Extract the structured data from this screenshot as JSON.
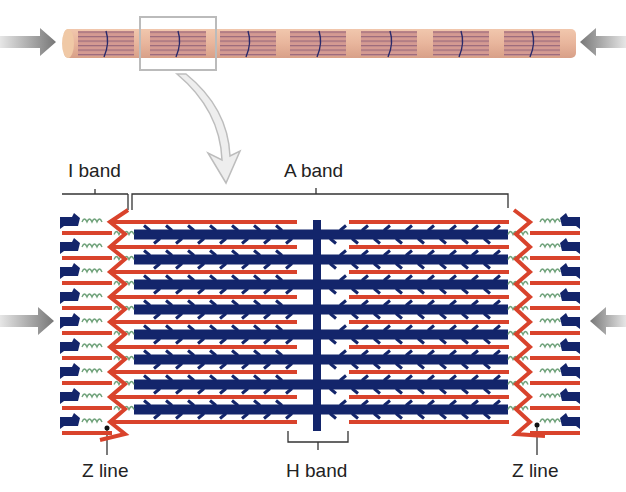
{
  "figure": {
    "labels": {
      "i_band": "I band",
      "a_band": "A band",
      "h_band": "H band",
      "z_line_left": "Z line",
      "z_line_right": "Z line"
    },
    "colors": {
      "actin": "#d9432c",
      "myosin": "#13256b",
      "titin": "#6fa27a",
      "myofibril": "#d9a08f",
      "myofibril_stripe": "#b07a7a",
      "arrow": "#8a8a8a",
      "label_line": "#333333"
    },
    "icons": {
      "compression_arrow_left": "arrow-right-icon",
      "compression_arrow_right": "arrow-left-icon",
      "zoom_callout": "curved-arrow-down-icon"
    },
    "structure": {
      "myofibril_segments": 7,
      "actin_rows": 9,
      "myosin_rows": 8
    }
  }
}
